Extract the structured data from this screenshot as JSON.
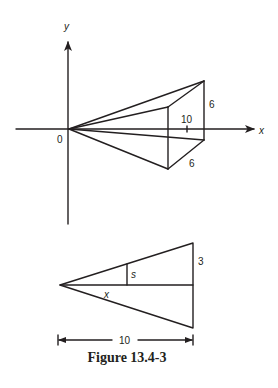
{
  "figure": {
    "caption": "Figure 13.4-3",
    "top_diagram": {
      "description": "Pyramid with apex at origin, square cross-section perpendicular to x-axis",
      "axis_x_label": "x",
      "axis_y_label": "y",
      "origin_label": "0",
      "height_label": "6",
      "depth_label": "6",
      "tick_label": "10"
    },
    "bottom_diagram": {
      "description": "Side triangle cross-section for similar triangles",
      "side_label": "3",
      "section_label": "s",
      "distance_label": "x",
      "width_label": "10"
    }
  },
  "colors": {
    "ink": "#231f20",
    "background": "#ffffff"
  }
}
